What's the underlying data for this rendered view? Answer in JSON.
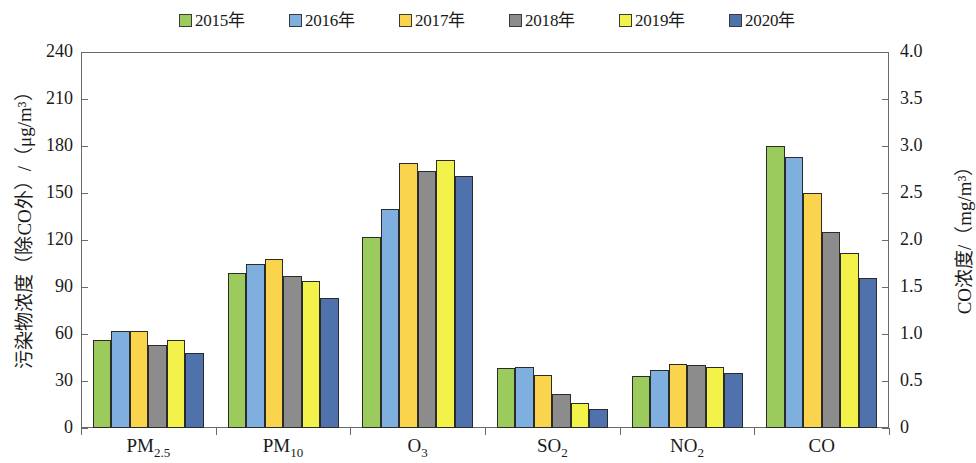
{
  "legend": {
    "items": [
      {
        "label": "2015年",
        "color": "#9BCB5C"
      },
      {
        "label": "2016年",
        "color": "#7FAFDE"
      },
      {
        "label": "2017年",
        "color": "#FAD44D"
      },
      {
        "label": "2018年",
        "color": "#8C8C8C"
      },
      {
        "label": "2019年",
        "color": "#F2F24A"
      },
      {
        "label": "2020年",
        "color": "#4F72AC"
      }
    ]
  },
  "axes": {
    "left_title": "污染物浓度（除CO外）/（μg/m³）",
    "right_title": "CO浓度/（mg/m³）",
    "left_ticks": [
      "240",
      "210",
      "180",
      "150",
      "120",
      "90",
      "60",
      "30",
      "0"
    ],
    "right_ticks": [
      "4.0",
      "3.5",
      "3.0",
      "2.5",
      "2.0",
      "1.5",
      "1.0",
      "0.5",
      "0"
    ]
  },
  "chart_data": {
    "type": "bar",
    "title": "",
    "xlabel": "",
    "ylabel": "污染物浓度（除CO外）/（μg/m³）",
    "y2label": "CO浓度/（mg/m³）",
    "ylim": [
      0,
      240
    ],
    "y2lim": [
      0,
      4.0
    ],
    "grid": false,
    "legend_position": "top-center",
    "categories": [
      "PM2.5",
      "PM10",
      "O3",
      "SO2",
      "NO2",
      "CO"
    ],
    "category_labels_html": [
      "PM<sub>2.5</sub>",
      "PM<sub>10</sub>",
      "O<sub>3</sub>",
      "SO<sub>2</sub>",
      "NO<sub>2</sub>",
      "CO"
    ],
    "note": "CO series is read on the right-hand axis (mg/m³); all other categories use the left axis (μg/m³).",
    "series": [
      {
        "name": "2015年",
        "color": "#9BCB5C",
        "values": [
          56,
          99,
          122,
          38,
          33,
          180
        ],
        "co_value_mg_m3": 3.0
      },
      {
        "name": "2016年",
        "color": "#7FAFDE",
        "values": [
          62,
          105,
          140,
          39,
          37,
          173
        ],
        "co_value_mg_m3": 2.88
      },
      {
        "name": "2017年",
        "color": "#FAD44D",
        "values": [
          62,
          108,
          169,
          34,
          41,
          150
        ],
        "co_value_mg_m3": 2.5
      },
      {
        "name": "2018年",
        "color": "#8C8C8C",
        "values": [
          53,
          97,
          164,
          22,
          40,
          125
        ],
        "co_value_mg_m3": 2.09
      },
      {
        "name": "2019年",
        "color": "#F2F24A",
        "values": [
          56,
          94,
          171,
          16,
          39,
          112
        ],
        "co_value_mg_m3": 1.87
      },
      {
        "name": "2020年",
        "color": "#4F72AC",
        "values": [
          48,
          83,
          161,
          12,
          35,
          96
        ],
        "co_value_mg_m3": 1.6
      }
    ]
  }
}
